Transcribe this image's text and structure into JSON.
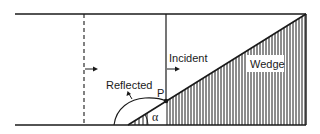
{
  "diagram": {
    "type": "shock reflection over a wedge",
    "labels": {
      "incident": "Incident",
      "reflected": "Reflected",
      "wedge": "Wedge",
      "point": "P",
      "angle": "α"
    },
    "colors": {
      "ink": "#1a1a1a",
      "background": "#ffffff"
    },
    "wedge_angle_deg_approx": 32
  }
}
